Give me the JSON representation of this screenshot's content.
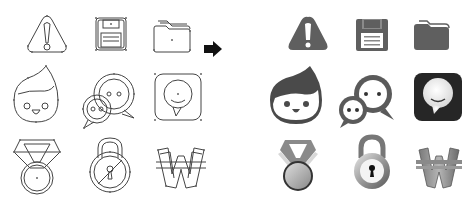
{
  "figure": {
    "left_panel": {
      "style": "outline",
      "rows": [
        [
          "warning-sketch",
          "save-sketch",
          "folder-sketch"
        ],
        [
          "face-sketch",
          "chat-sketch",
          "messenger-sketch"
        ],
        [
          "medal-sketch",
          "lock-sketch",
          "won-sketch"
        ]
      ]
    },
    "arrow": {
      "icon": "arrow-right-icon",
      "color": "#111111"
    },
    "right_panel": {
      "style": "filled",
      "rows": [
        [
          "warning",
          "save",
          "folder"
        ],
        [
          "face",
          "chat",
          "messenger"
        ],
        [
          "medal",
          "lock",
          "won"
        ]
      ]
    },
    "colors": {
      "outline_stroke": "#444444",
      "flat_fill": "#5f5f5f",
      "dark_fill": "#2a2a2a",
      "background": "#ffffff"
    }
  }
}
